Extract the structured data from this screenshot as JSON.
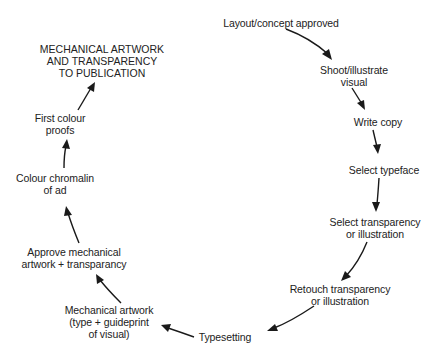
{
  "diagram": {
    "type": "cycle-flow",
    "title_lines": [
      "MECHANICAL ARTWORK",
      "AND TRANSPARENCY",
      "TO PUBLICATION"
    ],
    "steps": [
      {
        "id": "layout",
        "lines": [
          "Layout/concept approved"
        ]
      },
      {
        "id": "shoot",
        "lines": [
          "Shoot/illustrate",
          "visual"
        ]
      },
      {
        "id": "copy",
        "lines": [
          "Write copy"
        ]
      },
      {
        "id": "typeface",
        "lines": [
          "Select typeface"
        ]
      },
      {
        "id": "select-transparency",
        "lines": [
          "Select transparency",
          "or illustration"
        ]
      },
      {
        "id": "retouch",
        "lines": [
          "Retouch transparency",
          "or illustration"
        ]
      },
      {
        "id": "typesetting",
        "lines": [
          "Typesetting"
        ]
      },
      {
        "id": "mechanical",
        "lines": [
          "Mechanical artwork",
          "(type + guideprint",
          "of visual)"
        ]
      },
      {
        "id": "approve",
        "lines": [
          "Approve mechanical",
          "artwork + transparancy"
        ]
      },
      {
        "id": "chromalin",
        "lines": [
          "Colour chromalin",
          "of ad"
        ]
      },
      {
        "id": "proofs",
        "lines": [
          "First colour",
          "proofs"
        ]
      }
    ],
    "edges": [
      [
        "layout",
        "shoot"
      ],
      [
        "shoot",
        "copy"
      ],
      [
        "copy",
        "typeface"
      ],
      [
        "typeface",
        "select-transparency"
      ],
      [
        "select-transparency",
        "retouch"
      ],
      [
        "retouch",
        "typesetting"
      ],
      [
        "typesetting",
        "mechanical"
      ],
      [
        "mechanical",
        "approve"
      ],
      [
        "approve",
        "chromalin"
      ],
      [
        "chromalin",
        "proofs"
      ],
      [
        "proofs",
        "title"
      ]
    ],
    "colors": {
      "text": "#222222",
      "arrow": "#1a1a1a",
      "background": "#ffffff"
    }
  }
}
